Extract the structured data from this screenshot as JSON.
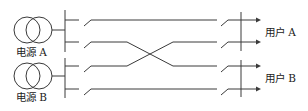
{
  "diagram": {
    "type": "power-supply-crossover-wiring",
    "colors": {
      "stroke": "#3a3a3a",
      "text": "#222222",
      "background": "#ffffff"
    },
    "sources": [
      {
        "id": "source-a",
        "label": "电源 A",
        "symbol": "transformer"
      },
      {
        "id": "source-b",
        "label": "电源 B",
        "symbol": "transformer"
      }
    ],
    "users": [
      {
        "id": "user-a",
        "label": "用户 A"
      },
      {
        "id": "user-b",
        "label": "用户 B"
      }
    ],
    "feeders": [
      {
        "from": "source-a",
        "to": "user-a",
        "crossed": false
      },
      {
        "from": "source-a",
        "to": "user-b",
        "crossed": true
      },
      {
        "from": "source-b",
        "to": "user-a",
        "crossed": true
      },
      {
        "from": "source-b",
        "to": "user-b",
        "crossed": false
      }
    ]
  }
}
